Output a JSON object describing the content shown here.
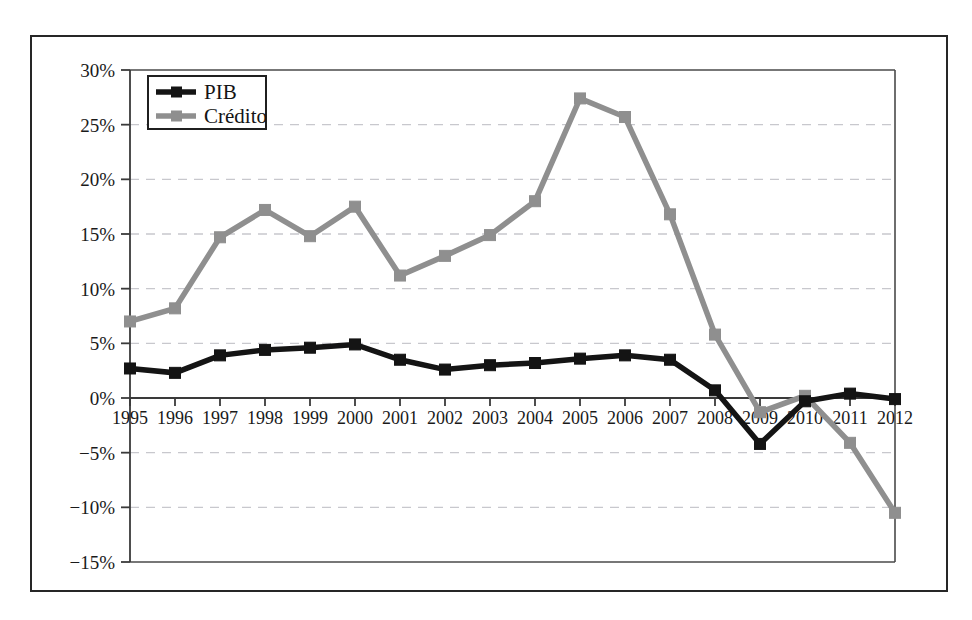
{
  "chart_data": {
    "type": "line",
    "title": "",
    "xlabel": "",
    "ylabel": "",
    "categories": [
      "1995",
      "1996",
      "1997",
      "1998",
      "1999",
      "2000",
      "2001",
      "2002",
      "2003",
      "2004",
      "2005",
      "2006",
      "2007",
      "2008",
      "2009",
      "2010",
      "2011",
      "2012"
    ],
    "ylim": [
      -15,
      30
    ],
    "ytick_labels": [
      "30%",
      "25%",
      "20%",
      "15%",
      "10%",
      "5%",
      "0%",
      "−5%",
      "−10%",
      "−15%"
    ],
    "ytick_values": [
      30,
      25,
      20,
      15,
      10,
      5,
      0,
      -5,
      -10,
      -15
    ],
    "grid": true,
    "legend_position": "top-left",
    "series": [
      {
        "name": "PIB",
        "color": "#141414",
        "marker": "square",
        "values": [
          2.7,
          2.3,
          3.9,
          4.4,
          4.6,
          4.9,
          3.5,
          2.6,
          3.0,
          3.2,
          3.6,
          3.9,
          3.5,
          0.7,
          -4.2,
          -0.3,
          0.4,
          -0.1
        ]
      },
      {
        "name": "Crédito",
        "color": "#8f8f8f",
        "marker": "square",
        "values": [
          7.0,
          8.2,
          14.7,
          17.2,
          14.8,
          17.5,
          11.2,
          13.0,
          14.9,
          18.0,
          27.4,
          25.7,
          16.8,
          5.8,
          -1.3,
          0.2,
          -4.1,
          -10.5
        ]
      }
    ]
  },
  "legend": {
    "items": [
      {
        "label": "PIB",
        "color": "#141414"
      },
      {
        "label": "Crédito",
        "color": "#8f8f8f"
      }
    ]
  }
}
